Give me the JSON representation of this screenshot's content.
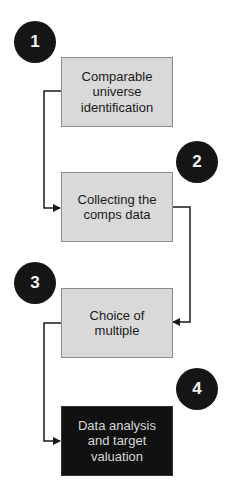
{
  "diagram": {
    "type": "process-flow",
    "steps": [
      {
        "number": "1",
        "label": "Comparable universe identification",
        "style": "light"
      },
      {
        "number": "2",
        "label": "Collecting the comps data",
        "style": "light"
      },
      {
        "number": "3",
        "label": "Choice of multiple",
        "style": "light"
      },
      {
        "number": "4",
        "label": "Data analysis and target valuation",
        "style": "dark"
      }
    ],
    "connections": [
      {
        "from": "1",
        "to": "2"
      },
      {
        "from": "2",
        "to": "3"
      },
      {
        "from": "3",
        "to": "4"
      }
    ],
    "colors": {
      "box_fill": "#d9d9d9",
      "box_fill_final": "#111111",
      "badge_fill": "#151515",
      "connector": "#1a1a1a"
    }
  }
}
